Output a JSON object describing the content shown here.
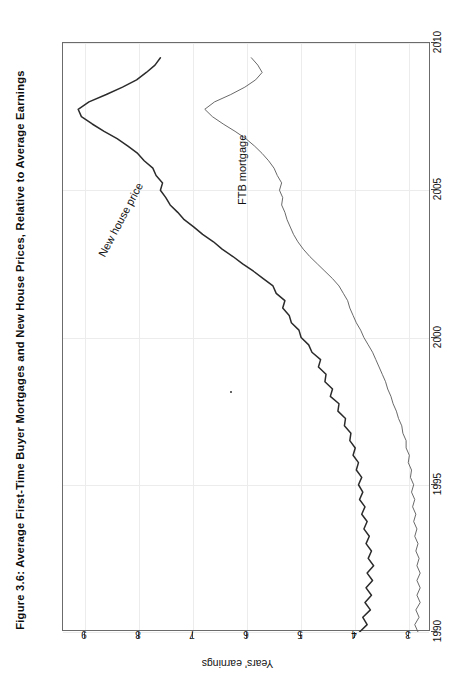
{
  "figure": {
    "title": "Figure 3.6: Average First-Time Buyer Mortgages and New House Prices, Relative to Average Earnings",
    "y_axis_title": "Years' earnings",
    "series_label_house": "New house price",
    "series_label_ftb": "FTB mortgage"
  },
  "chart_data": {
    "type": "line",
    "title": "Figure 3.6: Average First-Time Buyer Mortgages and New House Prices, Relative to Average Earnings",
    "xlabel": "",
    "ylabel": "Years' earnings",
    "orientation": "rotated-90",
    "grid": true,
    "legend": "inline-labels",
    "xlim": [
      1990,
      2010
    ],
    "ylim": [
      2.6,
      9.4
    ],
    "xticks": [
      1990,
      1995,
      2000,
      2005,
      2010
    ],
    "yticks": [
      3,
      4,
      5,
      6,
      7,
      8,
      9
    ],
    "x": [
      1990.0,
      1990.25,
      1990.5,
      1990.75,
      1991.0,
      1991.25,
      1991.5,
      1991.75,
      1992.0,
      1992.25,
      1992.5,
      1992.75,
      1993.0,
      1993.25,
      1993.5,
      1993.75,
      1994.0,
      1994.25,
      1994.5,
      1994.75,
      1995.0,
      1995.25,
      1995.5,
      1995.75,
      1996.0,
      1996.25,
      1996.5,
      1996.75,
      1997.0,
      1997.25,
      1997.5,
      1997.75,
      1998.0,
      1998.25,
      1998.5,
      1998.75,
      1999.0,
      1999.25,
      1999.5,
      1999.75,
      2000.0,
      2000.25,
      2000.5,
      2000.75,
      2001.0,
      2001.25,
      2001.5,
      2001.75,
      2002.0,
      2002.25,
      2002.5,
      2002.75,
      2003.0,
      2003.25,
      2003.5,
      2003.75,
      2004.0,
      2004.25,
      2004.5,
      2004.75,
      2005.0,
      2005.25,
      2005.5,
      2005.75,
      2006.0,
      2006.25,
      2006.5,
      2006.75,
      2007.0,
      2007.25,
      2007.5,
      2007.75,
      2008.0,
      2008.25,
      2008.5,
      2008.75,
      2009.0,
      2009.25,
      2009.5
    ],
    "series": [
      {
        "name": "New house price",
        "style": "thick",
        "color": "#2b2b2b",
        "values": [
          3.92,
          3.78,
          3.86,
          3.72,
          3.82,
          3.7,
          3.8,
          3.68,
          3.78,
          3.66,
          3.76,
          3.7,
          3.8,
          3.74,
          3.84,
          3.78,
          3.88,
          3.82,
          3.92,
          3.86,
          3.94,
          3.88,
          3.98,
          3.94,
          4.04,
          4.0,
          4.1,
          4.08,
          4.2,
          4.18,
          4.32,
          4.3,
          4.46,
          4.42,
          4.56,
          4.54,
          4.68,
          4.64,
          4.8,
          4.86,
          5.0,
          5.04,
          5.18,
          5.22,
          5.34,
          5.3,
          5.46,
          5.52,
          5.7,
          5.88,
          6.08,
          6.26,
          6.46,
          6.62,
          6.82,
          6.98,
          7.16,
          7.28,
          7.42,
          7.5,
          7.6,
          7.56,
          7.68,
          7.74,
          7.9,
          8.02,
          8.2,
          8.4,
          8.64,
          8.86,
          9.06,
          9.12,
          8.92,
          8.6,
          8.3,
          8.04,
          7.86,
          7.7,
          7.6
        ]
      },
      {
        "name": "FTB mortgage",
        "style": "thin",
        "color": "#4f4f4f",
        "values": [
          2.84,
          2.9,
          2.82,
          2.88,
          2.8,
          2.86,
          2.8,
          2.86,
          2.8,
          2.86,
          2.82,
          2.88,
          2.84,
          2.9,
          2.86,
          2.92,
          2.88,
          2.94,
          2.9,
          2.96,
          2.92,
          2.98,
          2.96,
          3.02,
          3.0,
          3.06,
          3.06,
          3.12,
          3.14,
          3.2,
          3.24,
          3.3,
          3.34,
          3.4,
          3.44,
          3.5,
          3.56,
          3.62,
          3.68,
          3.76,
          3.84,
          3.9,
          3.98,
          4.04,
          4.1,
          4.14,
          4.22,
          4.3,
          4.42,
          4.56,
          4.7,
          4.84,
          4.96,
          5.06,
          5.14,
          5.2,
          5.26,
          5.3,
          5.36,
          5.34,
          5.4,
          5.36,
          5.44,
          5.5,
          5.6,
          5.72,
          5.86,
          6.02,
          6.22,
          6.44,
          6.64,
          6.78,
          6.6,
          6.3,
          6.04,
          5.84,
          5.72,
          5.8,
          5.92
        ]
      }
    ]
  }
}
